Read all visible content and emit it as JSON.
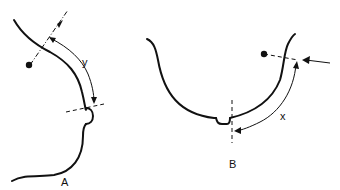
{
  "figure": {
    "panels": [
      {
        "id": "A",
        "label": "A",
        "measure_label": "y",
        "description": "Side (lateral) profile outline with curved dimension arrow y"
      },
      {
        "id": "B",
        "label": "B",
        "measure_label": "x",
        "description": "Frontal U-shaped outline with curved dimension arrow x"
      }
    ],
    "colors": {
      "stroke": "#111111",
      "background": "#ffffff"
    }
  }
}
